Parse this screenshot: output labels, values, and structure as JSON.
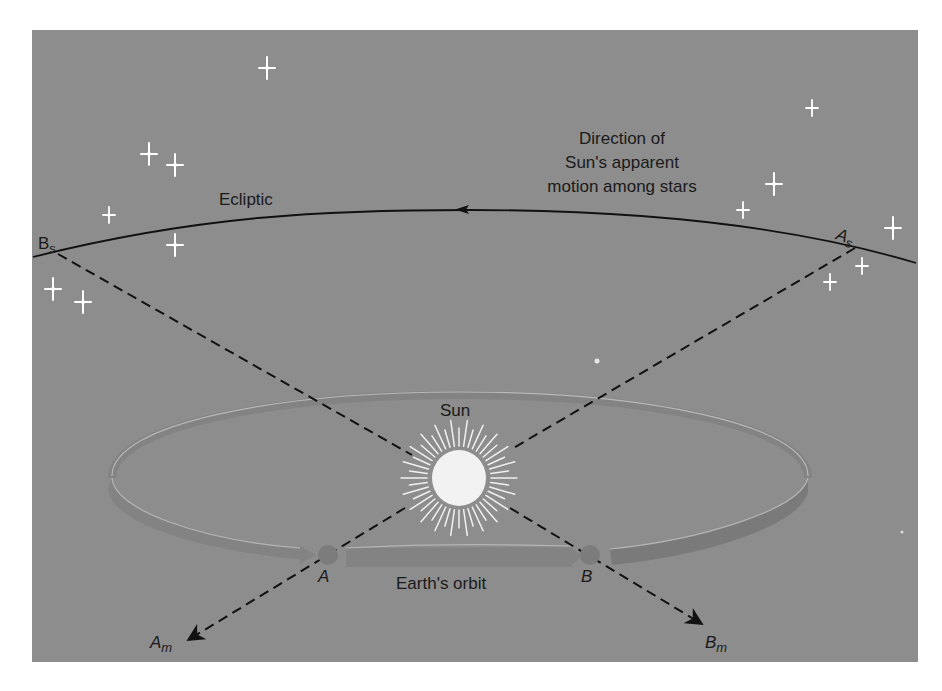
{
  "diagram": {
    "colors": {
      "background_panel": "#8d8d8d",
      "page": "#ffffff",
      "lines": "#111111",
      "stars": "#ffffff",
      "sun": "#f2f2f2",
      "orbit_band": "#858585",
      "orbit_highlight": "#b5b5b5"
    },
    "labels": {
      "ecliptic": "Ecliptic",
      "direction_line1": "Direction of",
      "direction_line2": "Sun's apparent",
      "direction_line3": "motion among stars",
      "sun": "Sun",
      "earth_orbit": "Earth's orbit",
      "point_a": "A",
      "point_b": "B",
      "bs_main": "B",
      "bs_sub": "s",
      "as_main": "A",
      "as_sub": "s",
      "am_main": "A",
      "am_sub": "m",
      "bm_main": "B",
      "bm_sub": "m"
    },
    "icons": {
      "star": "four-point-star",
      "sun": "radiant-sun",
      "arrow": "arrowhead"
    }
  }
}
